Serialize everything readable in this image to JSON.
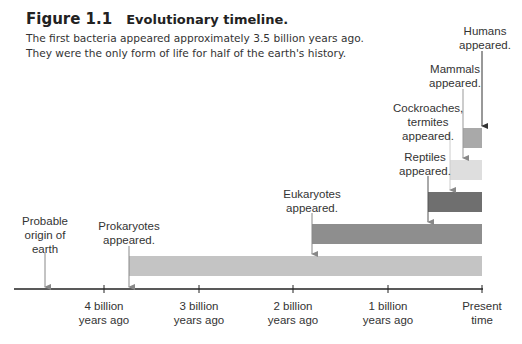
{
  "figure": {
    "number": "Figure 1.1",
    "title": "Evolutionary timeline.",
    "caption_line1": "The first bacteria appeared approximately 3.5 billion years ago.",
    "caption_line2": "They were the only form of life for half of the earth's history."
  },
  "axis": {
    "ticks": [
      {
        "line1": "4 billion",
        "line2": "years ago"
      },
      {
        "line1": "3 billion",
        "line2": "years ago"
      },
      {
        "line1": "2 billion",
        "line2": "years ago"
      },
      {
        "line1": "1 billion",
        "line2": "years ago"
      },
      {
        "line1": "Present",
        "line2": "time"
      }
    ]
  },
  "events": [
    {
      "label": [
        "Probable",
        "origin of",
        "earth"
      ],
      "time_bya": 4.6
    },
    {
      "label": [
        "Prokaryotes",
        "appeared."
      ],
      "time_bya": 3.5,
      "color": "#c4c4c4"
    },
    {
      "label": [
        "Eukaryotes",
        "appeared."
      ],
      "time_bya": 1.8,
      "color": "#8e8e8e"
    },
    {
      "label": [
        "Reptiles",
        "appeared."
      ],
      "time_bya": 0.57,
      "color": "#6f6f6f"
    },
    {
      "label": [
        "Cockroaches,",
        "termites",
        "appeared."
      ],
      "time_bya": 0.34,
      "color": "#dedede"
    },
    {
      "label": [
        "Mammals",
        "appeared."
      ],
      "time_bya": 0.2,
      "color": "#a9a9a9"
    },
    {
      "label": [
        "Humans",
        "appeared."
      ],
      "time_bya": 0.0
    }
  ]
}
